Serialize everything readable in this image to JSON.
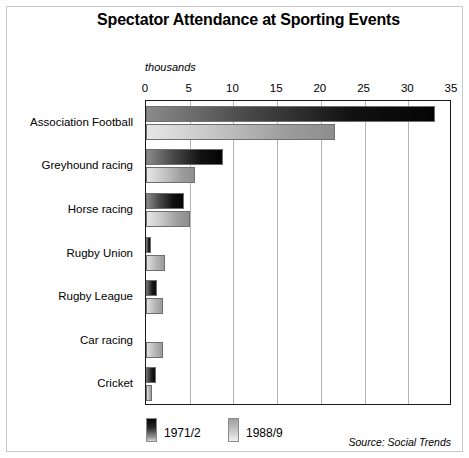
{
  "chart_data": {
    "type": "bar",
    "orientation": "horizontal",
    "title": "Spectator Attendance at Sporting Events",
    "xlabel": "thousands",
    "ylabel": "",
    "unit_label": "thousands",
    "xlim": [
      0,
      35
    ],
    "xticks": [
      0,
      5,
      10,
      15,
      20,
      25,
      30,
      35
    ],
    "xtick_labels": [
      "0",
      "5",
      "10",
      "15",
      "20",
      "25",
      "30",
      "35"
    ],
    "grid": true,
    "grid_axis": "x",
    "legend_position": "bottom-left",
    "categories": [
      "Association Football",
      "Greyhound racing",
      "Horse racing",
      "Rugby Union",
      "Rugby League",
      "Car racing",
      "Cricket"
    ],
    "series": [
      {
        "name": "1971/2",
        "color": "#111111",
        "values": [
          33.0,
          8.8,
          4.4,
          0.6,
          1.3,
          0.0,
          1.2
        ]
      },
      {
        "name": "1988/9",
        "color": "#b4b4b4",
        "values": [
          21.6,
          5.6,
          5.0,
          2.2,
          1.9,
          2.0,
          0.7
        ]
      }
    ],
    "annotations": [
      "Source: Social Trends"
    ],
    "source": "Source: Social Trends"
  },
  "figure": {
    "title": "Spectator Attendance at Sporting Events",
    "unit_label": "thousands",
    "source": "Source: Social Trends"
  },
  "legend": {
    "entries": [
      {
        "label": "1971/2"
      },
      {
        "label": "1988/9"
      }
    ]
  }
}
